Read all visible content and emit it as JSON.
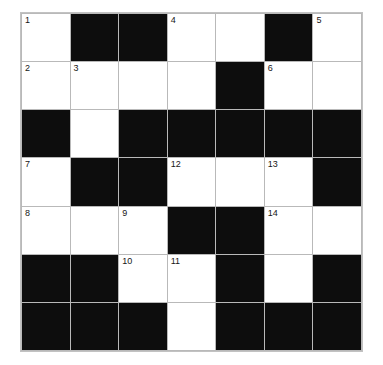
{
  "puzzle": {
    "kind": "crossword-grid",
    "rows": 7,
    "columns": 7,
    "colors": {
      "page_background": "#ffffff",
      "white_cell": "#ffffff",
      "black_cell": "#0d0d0d",
      "grid_line": "#b9b9b9",
      "number_text": "#161616"
    },
    "clue_numbers_present": [
      1,
      2,
      3,
      4,
      5,
      6,
      7,
      8,
      9,
      10,
      11,
      12,
      13,
      14
    ],
    "grid": [
      [
        {
          "type": "white",
          "number": "1"
        },
        {
          "type": "black",
          "number": ""
        },
        {
          "type": "black",
          "number": ""
        },
        {
          "type": "white",
          "number": "4"
        },
        {
          "type": "white",
          "number": ""
        },
        {
          "type": "black",
          "number": ""
        },
        {
          "type": "white",
          "number": "5"
        }
      ],
      [
        {
          "type": "white",
          "number": "2"
        },
        {
          "type": "white",
          "number": "3"
        },
        {
          "type": "white",
          "number": ""
        },
        {
          "type": "white",
          "number": ""
        },
        {
          "type": "black",
          "number": ""
        },
        {
          "type": "white",
          "number": "6"
        },
        {
          "type": "white",
          "number": ""
        }
      ],
      [
        {
          "type": "black",
          "number": ""
        },
        {
          "type": "white",
          "number": ""
        },
        {
          "type": "black",
          "number": ""
        },
        {
          "type": "black",
          "number": ""
        },
        {
          "type": "black",
          "number": ""
        },
        {
          "type": "black",
          "number": ""
        },
        {
          "type": "black",
          "number": ""
        }
      ],
      [
        {
          "type": "white",
          "number": "7"
        },
        {
          "type": "black",
          "number": ""
        },
        {
          "type": "black",
          "number": ""
        },
        {
          "type": "white",
          "number": "12"
        },
        {
          "type": "white",
          "number": ""
        },
        {
          "type": "white",
          "number": "13"
        },
        {
          "type": "black",
          "number": ""
        }
      ],
      [
        {
          "type": "white",
          "number": "8"
        },
        {
          "type": "white",
          "number": ""
        },
        {
          "type": "white",
          "number": "9"
        },
        {
          "type": "black",
          "number": ""
        },
        {
          "type": "black",
          "number": ""
        },
        {
          "type": "white",
          "number": "14"
        },
        {
          "type": "white",
          "number": ""
        }
      ],
      [
        {
          "type": "black",
          "number": ""
        },
        {
          "type": "black",
          "number": ""
        },
        {
          "type": "white",
          "number": "10"
        },
        {
          "type": "white",
          "number": "11"
        },
        {
          "type": "black",
          "number": ""
        },
        {
          "type": "white",
          "number": ""
        },
        {
          "type": "black",
          "number": ""
        }
      ],
      [
        {
          "type": "black",
          "number": ""
        },
        {
          "type": "black",
          "number": ""
        },
        {
          "type": "black",
          "number": ""
        },
        {
          "type": "white",
          "number": ""
        },
        {
          "type": "black",
          "number": ""
        },
        {
          "type": "black",
          "number": ""
        },
        {
          "type": "black",
          "number": ""
        }
      ]
    ]
  }
}
